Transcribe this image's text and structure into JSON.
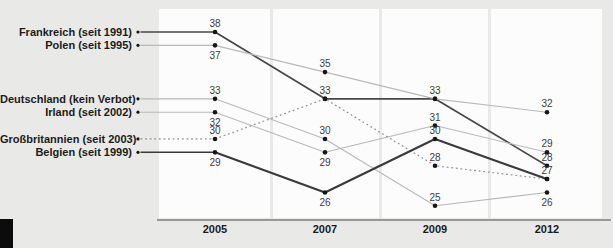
{
  "chart_data": {
    "type": "line",
    "title": "",
    "x_categories": [
      "2005",
      "2007",
      "2009",
      "2012"
    ],
    "xlabel": "",
    "ylabel": "",
    "ylim": [
      24,
      39
    ],
    "grid": "white-column-panels-per-year",
    "legend_position": "left-labels-with-leader-lines",
    "series": [
      {
        "label": "Frankreich (seit 1991)",
        "values": [
          38,
          33,
          33,
          28
        ],
        "style": "solid-dark",
        "color": "#474747",
        "value_label_pos": [
          "above",
          "above",
          "above",
          "above"
        ]
      },
      {
        "label": "Polen (seit 1995)",
        "values": [
          37,
          35,
          33,
          32
        ],
        "style": "solid-light",
        "color": "#b9b9b9",
        "value_label_pos": [
          "below",
          "above",
          "hidden",
          "above"
        ]
      },
      {
        "label": "Deutschland (kein Verbot)",
        "values": [
          33,
          30,
          25,
          26
        ],
        "style": "solid-light",
        "color": "#b9b9b9",
        "value_label_pos": [
          "above",
          "above",
          "above",
          "below"
        ]
      },
      {
        "label": "Irland (seit 2002)",
        "values": [
          32,
          29,
          31,
          29
        ],
        "style": "solid-light",
        "color": "#b9b9b9",
        "value_label_pos": [
          "below",
          "below",
          "above",
          "above"
        ]
      },
      {
        "label": "Großbritannien (seit 2003)",
        "values": [
          30,
          33,
          28,
          27
        ],
        "style": "dotted",
        "color": "#8f8f8f",
        "value_label_pos": [
          "above",
          "hidden",
          "above",
          "hidden"
        ]
      },
      {
        "label": "Belgien (seit 1999)",
        "values": [
          29,
          26,
          30,
          27
        ],
        "style": "solid-thick-dark",
        "color": "#3a3a3a",
        "value_label_pos": [
          "below",
          "below",
          "above",
          "above"
        ]
      }
    ]
  },
  "colors": {
    "background": "#e9e9e8",
    "panel": "#fcfcfc",
    "axis": "#7c7c7c",
    "label_text": "#1b1b1b",
    "value_text": "#3d3d3d",
    "point": "#161616",
    "corner_block": "#0c0c0c"
  }
}
